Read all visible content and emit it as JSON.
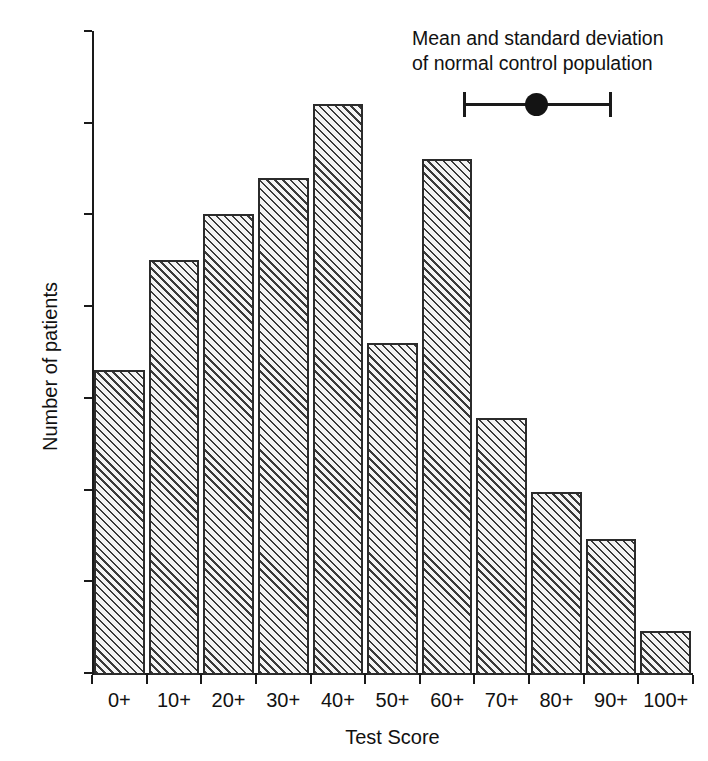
{
  "chart_data": {
    "type": "bar",
    "title": "",
    "xlabel": "Test Score",
    "ylabel": "Number of patients",
    "categories": [
      "0+",
      "10+",
      "20+",
      "30+",
      "40+",
      "50+",
      "60+",
      "70+",
      "80+",
      "90+",
      "100+"
    ],
    "values": [
      33,
      45,
      50,
      54,
      62,
      36,
      56,
      27.8,
      19.7,
      14.6,
      4.6
    ],
    "ylim": [
      0,
      70
    ],
    "yticks": [
      0,
      10,
      20,
      30,
      40,
      50,
      60,
      70
    ],
    "ytick_labels": [
      "0",
      "10",
      "20",
      "30",
      "40",
      "50",
      "60",
      "70"
    ],
    "grid": false,
    "legend_position": "top-right",
    "annotations": [
      {
        "name": "normal-control-marker",
        "text_lines": [
          "Mean and standard deviation",
          "of normal control population"
        ],
        "marker_type": "mean-with-sd-errorbar",
        "mean_test_score": 75,
        "sd_low_test_score": 61,
        "sd_high_test_score": 89
      }
    ]
  },
  "axes": {
    "y_title": "Number of patients",
    "x_title": "Test Score",
    "y_tick_labels": [
      "70",
      "60",
      "50",
      "40",
      "30",
      "20",
      "10",
      "0"
    ],
    "x_tick_labels": [
      "0+",
      "10+",
      "20+",
      "30+",
      "40+",
      "50+",
      "60+",
      "70+",
      "80+",
      "90+",
      "100+"
    ]
  },
  "annotation": {
    "line1": "Mean and standard deviation",
    "line2": "of normal control population"
  },
  "style": {
    "bar_edge_color": "#2b2b2b",
    "bar_hatch_color": "#3a3a3a",
    "bar_fill_color": "#f4f4f4",
    "axis_color": "#1a1a1a",
    "text_color": "#111111",
    "background_color": "#ffffff",
    "marker_color": "#141414"
  }
}
